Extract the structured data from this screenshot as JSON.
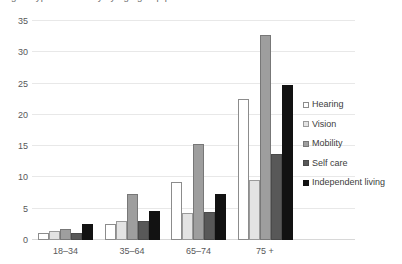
{
  "clipped_header_text": "figure type of disability by age group percent",
  "chart_data": {
    "type": "bar",
    "title": "",
    "xlabel": "",
    "ylabel": "",
    "categories": [
      "18–34",
      "35–64",
      "65–74",
      "75 +"
    ],
    "series": [
      {
        "name": "Hearing",
        "color": "#ffffff",
        "values": [
          1.2,
          2.5,
          9.2,
          22.5
        ]
      },
      {
        "name": "Vision",
        "color": "#e3e3e3",
        "values": [
          1.5,
          3.0,
          4.3,
          9.6
        ]
      },
      {
        "name": "Mobility",
        "color": "#9e9e9e",
        "values": [
          1.8,
          7.3,
          15.4,
          32.8
        ]
      },
      {
        "name": "Self care",
        "color": "#585858",
        "values": [
          1.2,
          3.0,
          4.4,
          13.7
        ]
      },
      {
        "name": "Independent living",
        "color": "#121212",
        "values": [
          2.6,
          4.6,
          7.4,
          24.8
        ]
      }
    ],
    "ylim": [
      0,
      35
    ],
    "yticks": [
      0,
      5,
      10,
      15,
      20,
      25,
      30,
      35
    ],
    "grid": true,
    "legend_position": "right"
  }
}
